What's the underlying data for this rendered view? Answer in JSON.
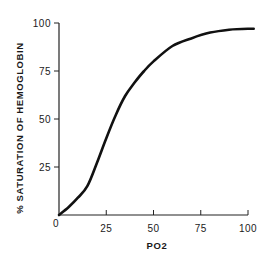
{
  "chart_data": {
    "type": "line",
    "title": "",
    "xlabel": "PO2",
    "ylabel": "% SATURATION OF HEMOGLOBIN",
    "xlim": [
      0,
      100
    ],
    "ylim": [
      0,
      100
    ],
    "xticks": [
      0,
      25,
      50,
      75,
      100
    ],
    "yticks": [
      25,
      50,
      75,
      100
    ],
    "x_tick_labels": [
      "0",
      "25",
      "50",
      "75",
      "100"
    ],
    "y_tick_labels": [
      "25",
      "50",
      "75",
      "100"
    ],
    "grid": false,
    "legend": null,
    "series": [
      {
        "name": "Oxyhemoglobin dissociation curve",
        "x": [
          0,
          5,
          10,
          15,
          20,
          25,
          30,
          35,
          40,
          45,
          50,
          60,
          70,
          80,
          90,
          100,
          103
        ],
        "y": [
          0,
          4,
          9,
          15,
          27,
          40,
          52,
          62,
          69,
          75,
          80,
          88,
          92,
          95,
          96.5,
          97,
          97
        ]
      }
    ]
  }
}
